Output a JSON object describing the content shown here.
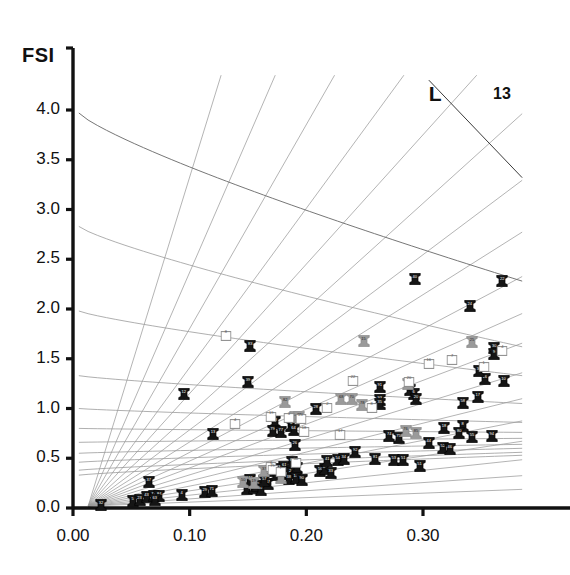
{
  "chart_data": {
    "type": "scatter",
    "title": "",
    "xlabel": "",
    "ylabel": "FSI",
    "xlim": [
      0.0,
      0.385
    ],
    "ylim": [
      0.0,
      4.35
    ],
    "grid": true,
    "legend_position": "none",
    "xticks": [
      "0.00",
      "0.10",
      "0.20",
      "0.30"
    ],
    "xtick_values": [
      0.0,
      0.1,
      0.2,
      0.3
    ],
    "yticks": [
      "0.0",
      "0.5",
      "1.0",
      "1.5",
      "2.0",
      "2.5",
      "3.0",
      "3.5",
      "4.0"
    ],
    "ytick_values": [
      0.0,
      0.5,
      1.0,
      1.5,
      2.0,
      2.5,
      3.0,
      3.5,
      4.0
    ],
    "annotations": [
      {
        "text": "L",
        "x": 0.305,
        "y": 4.28
      },
      {
        "text": "13",
        "x": 0.36,
        "y": 4.27
      }
    ],
    "radial_lines_origin": [
      0.013,
      0.02
    ],
    "radial_lines_slopes": [
      38.0,
      27.0,
      20.5,
      16.0,
      13.0,
      10.6,
      8.8,
      7.4,
      6.2,
      5.2,
      4.4,
      3.6,
      2.9,
      2.3,
      1.75,
      1.25,
      0.82,
      0.45
    ],
    "descending_curves_intercepts": [
      3.97,
      2.83,
      1.98,
      1.33,
      1.0,
      0.8,
      0.66,
      0.55,
      0.46,
      0.38,
      0.33
    ],
    "descending_curves_end_values": [
      2.28,
      1.62,
      1.33,
      1.05,
      0.86,
      0.76,
      0.7,
      0.64,
      0.6,
      0.56,
      0.53
    ],
    "series": [
      {
        "name": "black",
        "color": "#151515",
        "points": [
          {
            "label": "32",
            "x": 0.024,
            "y": 0.05
          },
          {
            "label": "5",
            "x": 0.051,
            "y": 0.09
          },
          {
            "label": "23",
            "x": 0.057,
            "y": 0.1
          },
          {
            "label": "43",
            "x": 0.063,
            "y": 0.13
          },
          {
            "label": "72",
            "x": 0.069,
            "y": 0.14
          },
          {
            "label": "84",
            "x": 0.074,
            "y": 0.14
          },
          {
            "label": "63",
            "x": 0.07,
            "y": 0.1
          },
          {
            "label": "37",
            "x": 0.065,
            "y": 0.28
          },
          {
            "label": "4",
            "x": 0.093,
            "y": 0.15
          },
          {
            "label": "29",
            "x": 0.113,
            "y": 0.18
          },
          {
            "label": "71",
            "x": 0.119,
            "y": 0.19
          },
          {
            "label": "62",
            "x": 0.149,
            "y": 0.21
          },
          {
            "label": "86",
            "x": 0.155,
            "y": 0.22
          },
          {
            "label": "45",
            "x": 0.158,
            "y": 0.24
          },
          {
            "label": "31",
            "x": 0.161,
            "y": 0.2
          },
          {
            "label": "47",
            "x": 0.167,
            "y": 0.26
          },
          {
            "label": "42",
            "x": 0.152,
            "y": 0.3
          },
          {
            "label": "57",
            "x": 0.164,
            "y": 0.29
          },
          {
            "label": "27",
            "x": 0.17,
            "y": 0.39
          },
          {
            "label": "53",
            "x": 0.176,
            "y": 0.41
          },
          {
            "label": "61",
            "x": 0.181,
            "y": 0.43
          },
          {
            "label": "67",
            "x": 0.174,
            "y": 0.35
          },
          {
            "label": "49",
            "x": 0.18,
            "y": 0.36
          },
          {
            "label": "2",
            "x": 0.186,
            "y": 0.37
          },
          {
            "label": "38",
            "x": 0.185,
            "y": 0.31
          },
          {
            "label": "73",
            "x": 0.192,
            "y": 0.42
          },
          {
            "label": "14",
            "x": 0.191,
            "y": 0.32
          },
          {
            "label": "65",
            "x": 0.188,
            "y": 0.48
          },
          {
            "label": "26",
            "x": 0.19,
            "y": 0.65
          },
          {
            "label": "90",
            "x": 0.196,
            "y": 0.3
          },
          {
            "label": "56",
            "x": 0.212,
            "y": 0.39
          },
          {
            "label": "89",
            "x": 0.216,
            "y": 0.41
          },
          {
            "label": "33",
            "x": 0.221,
            "y": 0.37
          },
          {
            "label": "54",
            "x": 0.227,
            "y": 0.5
          },
          {
            "label": "34",
            "x": 0.232,
            "y": 0.51
          },
          {
            "label": "41",
            "x": 0.218,
            "y": 0.49
          },
          {
            "label": "92",
            "x": 0.242,
            "y": 0.58
          },
          {
            "label": "81",
            "x": 0.259,
            "y": 0.51
          },
          {
            "label": "53b",
            "x": 0.275,
            "y": 0.5
          },
          {
            "label": "51",
            "x": 0.283,
            "y": 0.5
          },
          {
            "label": "51b",
            "x": 0.297,
            "y": 0.44
          },
          {
            "label": "44",
            "x": 0.305,
            "y": 0.67
          },
          {
            "label": "52",
            "x": 0.317,
            "y": 0.62
          },
          {
            "label": "46",
            "x": 0.323,
            "y": 0.61
          },
          {
            "label": "55",
            "x": 0.342,
            "y": 0.73
          },
          {
            "label": "74",
            "x": 0.271,
            "y": 0.74
          },
          {
            "label": "75",
            "x": 0.279,
            "y": 0.72
          },
          {
            "label": "18",
            "x": 0.318,
            "y": 0.82
          },
          {
            "label": "8",
            "x": 0.334,
            "y": 0.84
          },
          {
            "label": "80",
            "x": 0.331,
            "y": 0.77
          },
          {
            "label": "94",
            "x": 0.359,
            "y": 0.74
          },
          {
            "label": "58",
            "x": 0.334,
            "y": 1.08
          },
          {
            "label": "16",
            "x": 0.353,
            "y": 1.32
          },
          {
            "label": "10",
            "x": 0.369,
            "y": 1.3
          },
          {
            "label": "88",
            "x": 0.289,
            "y": 1.21
          },
          {
            "label": "6",
            "x": 0.292,
            "y": 1.17
          },
          {
            "label": "20",
            "x": 0.294,
            "y": 1.12
          },
          {
            "label": "91",
            "x": 0.263,
            "y": 1.24
          },
          {
            "label": "93",
            "x": 0.263,
            "y": 1.11
          },
          {
            "label": "35",
            "x": 0.263,
            "y": 1.07
          },
          {
            "label": "28",
            "x": 0.208,
            "y": 1.02
          },
          {
            "label": "48",
            "x": 0.173,
            "y": 0.88
          },
          {
            "label": "79",
            "x": 0.171,
            "y": 0.79
          },
          {
            "label": "77",
            "x": 0.178,
            "y": 0.78
          },
          {
            "label": "9",
            "x": 0.187,
            "y": 0.84
          },
          {
            "label": "64",
            "x": 0.189,
            "y": 0.8
          },
          {
            "label": "13",
            "x": 0.12,
            "y": 0.76
          },
          {
            "label": "12",
            "x": 0.095,
            "y": 1.17
          },
          {
            "label": "39",
            "x": 0.15,
            "y": 1.29
          },
          {
            "label": "83",
            "x": 0.152,
            "y": 1.65
          },
          {
            "label": "24",
            "x": 0.34,
            "y": 2.05
          },
          {
            "label": "22",
            "x": 0.368,
            "y": 2.3
          },
          {
            "label": "40",
            "x": 0.293,
            "y": 2.32
          },
          {
            "label": "30",
            "x": 0.361,
            "y": 1.63
          },
          {
            "label": "9b",
            "x": 0.361,
            "y": 1.57
          },
          {
            "label": "36",
            "x": 0.348,
            "y": 1.4
          },
          {
            "label": "17",
            "x": 0.347,
            "y": 1.14
          }
        ]
      },
      {
        "name": "gray",
        "color": "#9a9a9a",
        "points": [
          {
            "label": "50",
            "x": 0.146,
            "y": 0.28
          },
          {
            "label": "19",
            "x": 0.155,
            "y": 0.27
          },
          {
            "label": "37g",
            "x": 0.164,
            "y": 0.39
          },
          {
            "label": "66",
            "x": 0.178,
            "y": 0.32
          },
          {
            "label": "11",
            "x": 0.19,
            "y": 0.93
          },
          {
            "label": "21",
            "x": 0.194,
            "y": 0.93
          },
          {
            "label": "82",
            "x": 0.182,
            "y": 1.09
          },
          {
            "label": "68",
            "x": 0.23,
            "y": 1.12
          },
          {
            "label": "70",
            "x": 0.239,
            "y": 1.12
          },
          {
            "label": "78",
            "x": 0.248,
            "y": 1.06
          },
          {
            "label": "15",
            "x": 0.249,
            "y": 1.7
          },
          {
            "label": "25",
            "x": 0.342,
            "y": 1.69
          },
          {
            "label": "59",
            "x": 0.287,
            "y": 1.27
          },
          {
            "label": "76",
            "x": 0.285,
            "y": 0.79
          },
          {
            "label": "85",
            "x": 0.294,
            "y": 0.77
          }
        ]
      },
      {
        "name": "open",
        "color": "#ffffff",
        "points": [
          {
            "label": "8",
            "x": 0.131,
            "y": 1.77
          },
          {
            "label": "4",
            "x": 0.139,
            "y": 0.88
          },
          {
            "label": "19",
            "x": 0.17,
            "y": 0.95
          },
          {
            "label": "3",
            "x": 0.185,
            "y": 0.94
          },
          {
            "label": "23",
            "x": 0.195,
            "y": 0.93
          },
          {
            "label": "18",
            "x": 0.198,
            "y": 0.8
          },
          {
            "label": "6",
            "x": 0.17,
            "y": 0.45
          },
          {
            "label": "79",
            "x": 0.171,
            "y": 0.42
          },
          {
            "label": "7",
            "x": 0.178,
            "y": 0.4
          },
          {
            "label": "50",
            "x": 0.191,
            "y": 0.49
          },
          {
            "label": "17",
            "x": 0.229,
            "y": 0.77
          },
          {
            "label": "22",
            "x": 0.24,
            "y": 1.32
          },
          {
            "label": "2",
            "x": 0.218,
            "y": 1.05
          },
          {
            "label": "8b",
            "x": 0.256,
            "y": 1.05
          },
          {
            "label": "20",
            "x": 0.288,
            "y": 1.31
          },
          {
            "label": "16",
            "x": 0.305,
            "y": 1.49
          },
          {
            "label": "7b",
            "x": 0.325,
            "y": 1.53
          },
          {
            "label": "4b",
            "x": 0.368,
            "y": 1.62
          },
          {
            "label": "1",
            "x": 0.352,
            "y": 1.46
          }
        ]
      }
    ]
  }
}
